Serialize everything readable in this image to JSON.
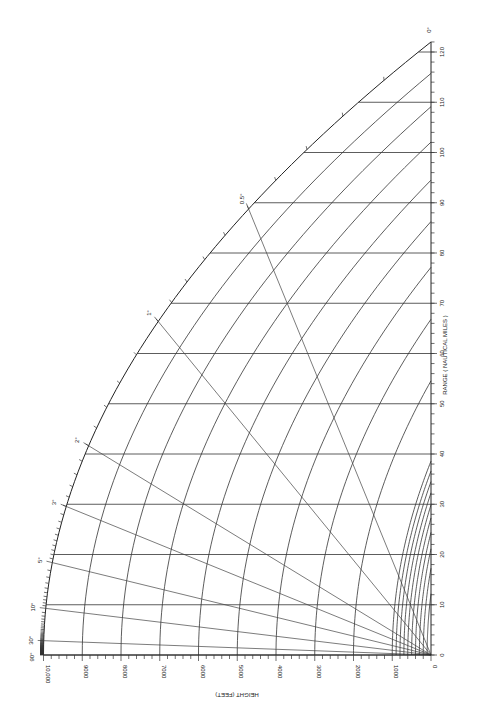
{
  "chart_data": {
    "type": "line",
    "title": "",
    "xlabel": "RANGE ( NAUTICAL MILES )",
    "ylabel": "HEIGHT (FEET)",
    "range_ticks": [
      0,
      10,
      20,
      30,
      40,
      50,
      60,
      70,
      80,
      90,
      100,
      110,
      120
    ],
    "range_tick_labels": [
      "0",
      "10",
      "20",
      "30",
      "40",
      "50",
      "60",
      "70",
      "80",
      "90",
      "100",
      "110",
      "120"
    ],
    "height_ticks": [
      0,
      1000,
      2000,
      3000,
      4000,
      5000,
      6000,
      7000,
      8000,
      9000,
      10000
    ],
    "height_tick_labels": [
      "0",
      "1000",
      "2000",
      "3000",
      "4000",
      "5000",
      "6000",
      "7000",
      "8000",
      "9000",
      "10,000"
    ],
    "height_curves_ft": [
      100,
      200,
      300,
      400,
      500,
      600,
      700,
      800,
      900,
      1000,
      2000,
      3000,
      4000,
      5000,
      6000,
      7000,
      8000,
      9000,
      10000
    ],
    "elevation_angles_deg": [
      0,
      0.5,
      1,
      2,
      3,
      5,
      10,
      30,
      90
    ],
    "elevation_angle_labels": [
      "0°",
      "0.5°",
      "1°",
      "2°",
      "3°",
      "5°",
      "10°",
      "30°",
      "90°"
    ],
    "xlim": [
      0,
      122
    ],
    "ylim": [
      0,
      10000
    ],
    "grid": true,
    "legend": "none"
  }
}
